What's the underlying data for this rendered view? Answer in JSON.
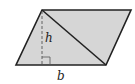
{
  "diagram": {
    "shape": "parallelogram",
    "vertices": {
      "top_left": [
        42,
        10
      ],
      "top_right": [
        131,
        10
      ],
      "bottom_right": [
        106,
        65
      ],
      "bottom_left": [
        16,
        65
      ]
    },
    "diagonal": {
      "from": "top_left",
      "to": "bottom_right"
    },
    "height_line": {
      "style": "dashed",
      "x": 42,
      "y1": 10,
      "y2": 65,
      "right_angle_marker": true
    },
    "labels": {
      "height": "h",
      "base": "b"
    },
    "colors": {
      "fill": "#d6d6d6",
      "stroke": "#222222",
      "dashed": "#555555"
    }
  }
}
